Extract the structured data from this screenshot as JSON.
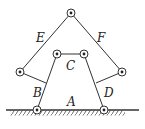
{
  "diagram": {
    "type": "linkage mechanism",
    "labels": {
      "A": "A",
      "B": "B",
      "C": "C",
      "D": "D",
      "E": "E",
      "F": "F"
    },
    "colors": {
      "line": "#333333",
      "background": "#ffffff"
    }
  }
}
